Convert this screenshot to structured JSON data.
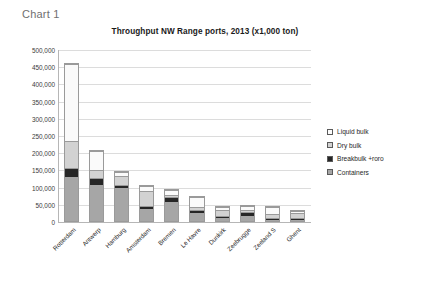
{
  "caption": "Chart 1",
  "legend": {
    "position": "right",
    "items": [
      {
        "label": "Liquid bulk",
        "swatch": "liquid-bulk-swatch",
        "color": "#fcfcfc"
      },
      {
        "label": "Dry bulk",
        "swatch": "dry-bulk-swatch",
        "color": "#d2d2d2"
      },
      {
        "label": "Breakbulk +roro",
        "swatch": "breakbulk-roro-swatch",
        "color": "#262626"
      },
      {
        "label": "Containers",
        "swatch": "containers-swatch",
        "color": "#a6a6a6"
      }
    ]
  },
  "chart_data": {
    "type": "bar",
    "stacked": true,
    "title": "Throughput NW Range ports, 2013 (x1,000 ton)",
    "xlabel": "",
    "ylabel": "",
    "ylim": [
      0,
      500000
    ],
    "grid": true,
    "ytick_labels": [
      "500,000",
      "450,000",
      "400,000",
      "350,000",
      "300,000",
      "250,000",
      "200,000",
      "150,000",
      "100,000",
      "50,000",
      "0"
    ],
    "ytick_values": [
      500000,
      450000,
      400000,
      350000,
      300000,
      250000,
      200000,
      150000,
      100000,
      50000,
      0
    ],
    "categories": [
      "Rotterdam",
      "Antwerp",
      "Hamburg",
      "Amsterdam",
      "Bremen",
      "Le Havre",
      "Dunkirk",
      "Zeebrugge",
      "Zeeland S",
      "Ghent"
    ],
    "series": [
      {
        "name": "Containers",
        "color": "#a6a6a6",
        "values": [
          128000,
          105000,
          95000,
          35000,
          55000,
          24000,
          10000,
          14000,
          4000,
          4000
        ]
      },
      {
        "name": "Breakbulk +roro",
        "color": "#262626",
        "values": [
          23000,
          17000,
          7000,
          5000,
          11000,
          5000,
          3000,
          9000,
          2000,
          2000
        ]
      },
      {
        "name": "Dry bulk",
        "color": "#d2d2d2",
        "values": [
          75000,
          20000,
          22000,
          42000,
          4000,
          5000,
          13000,
          2000,
          9000,
          12000
        ]
      },
      {
        "name": "Liquid bulk",
        "color": "#fafafa",
        "values": [
          222000,
          53000,
          11000,
          11000,
          12000,
          28000,
          5000,
          9000,
          17000,
          2000
        ]
      }
    ],
    "totals": [
      448000,
      195000,
      135000,
      93000,
      82000,
      62000,
      31000,
      34000,
      32000,
      20000
    ]
  }
}
